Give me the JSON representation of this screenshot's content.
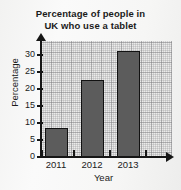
{
  "chart_data": {
    "type": "bar",
    "title": "Percentage of people in UK who use a tablet",
    "title_lines": [
      "Percentage of people in",
      "UK who use a tablet"
    ],
    "xlabel": "Year",
    "ylabel": "Percentage",
    "categories": [
      "2011",
      "2012",
      "2013"
    ],
    "values": [
      8.5,
      22.5,
      31
    ],
    "ylim": [
      0,
      33
    ],
    "yticks": [
      0,
      5,
      10,
      15,
      20,
      25,
      30
    ],
    "ytick_labels": [
      "0",
      "5",
      "10",
      "15",
      "20",
      "25",
      "30"
    ],
    "grid": true,
    "grid_style": "graph-paper",
    "legend": null,
    "bar_color": "#5c5c5c",
    "bar_edge_color": "#121212",
    "axis_color": "#161616",
    "plot_background": "#ebebea",
    "page_background": "#f7f7f6",
    "axis_arrows": true
  }
}
